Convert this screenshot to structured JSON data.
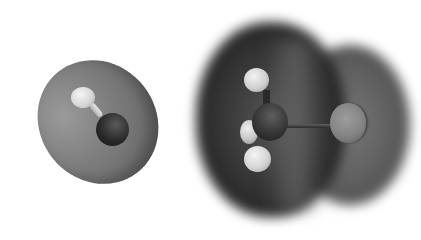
{
  "figure": {
    "molecules": [
      {
        "name": "hydroxyl-radical",
        "atoms": [
          "H",
          "O"
        ],
        "surface_color": "#7e7e7e"
      },
      {
        "name": "methyl-halide",
        "atoms": [
          "H",
          "H",
          "H",
          "C",
          "X"
        ],
        "surface_color": "#2a2a2a"
      }
    ]
  }
}
